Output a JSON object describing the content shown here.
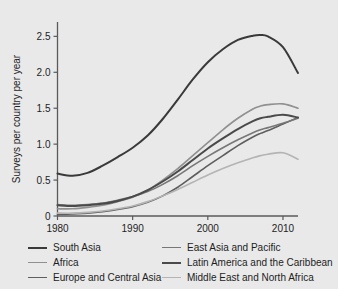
{
  "chart_data": {
    "type": "line",
    "title": "",
    "xlabel": "",
    "ylabel": "Surveys per country per year",
    "xlim": [
      1980,
      2012
    ],
    "ylim": [
      0,
      2.7
    ],
    "grid": false,
    "legend_position": "bottom",
    "x_ticks": [
      "1980",
      "1990",
      "2000",
      "2010"
    ],
    "x_tick_values": [
      1980,
      1990,
      2000,
      2010
    ],
    "y_ticks": [
      "0",
      "0.5",
      "1.0",
      "1.5",
      "2.0",
      "2.5"
    ],
    "y_tick_values": [
      0,
      0.5,
      1.0,
      1.5,
      2.0,
      2.5
    ],
    "x": [
      1980,
      1982,
      1984,
      1986,
      1988,
      1990,
      1992,
      1994,
      1996,
      1998,
      2000,
      2002,
      2004,
      2006,
      2007,
      2008,
      2010,
      2012
    ],
    "series": [
      {
        "name": "South Asia",
        "color": "#3a3a3a",
        "width": 2.0,
        "values": [
          0.59,
          0.56,
          0.6,
          0.7,
          0.82,
          0.95,
          1.12,
          1.35,
          1.62,
          1.9,
          2.14,
          2.32,
          2.45,
          2.51,
          2.52,
          2.5,
          2.35,
          1.99
        ]
      },
      {
        "name": "Africa",
        "color": "#909090",
        "width": 1.6,
        "values": [
          0.1,
          0.1,
          0.12,
          0.15,
          0.2,
          0.26,
          0.36,
          0.5,
          0.66,
          0.84,
          1.02,
          1.2,
          1.36,
          1.49,
          1.53,
          1.55,
          1.56,
          1.5
        ]
      },
      {
        "name": "Europe and Central Asia",
        "color": "#5e5e5e",
        "width": 1.6,
        "values": [
          0.02,
          0.03,
          0.04,
          0.06,
          0.09,
          0.13,
          0.19,
          0.28,
          0.4,
          0.55,
          0.7,
          0.84,
          0.98,
          1.1,
          1.15,
          1.19,
          1.28,
          1.37
        ]
      },
      {
        "name": "East Asia and Pacific",
        "color": "#777777",
        "width": 1.6,
        "values": [
          0.16,
          0.15,
          0.16,
          0.18,
          0.22,
          0.27,
          0.34,
          0.44,
          0.56,
          0.7,
          0.83,
          0.95,
          1.06,
          1.16,
          1.2,
          1.23,
          1.29,
          1.36
        ]
      },
      {
        "name": "Latin America and the Caribbean",
        "color": "#4a4a4a",
        "width": 2.0,
        "values": [
          0.15,
          0.14,
          0.15,
          0.17,
          0.21,
          0.27,
          0.36,
          0.48,
          0.62,
          0.78,
          0.94,
          1.08,
          1.21,
          1.32,
          1.36,
          1.38,
          1.41,
          1.37
        ]
      },
      {
        "name": "Middle East and North Africa",
        "color": "#b4b4b4",
        "width": 1.6,
        "values": [
          0.04,
          0.04,
          0.05,
          0.07,
          0.1,
          0.14,
          0.2,
          0.28,
          0.37,
          0.47,
          0.57,
          0.66,
          0.74,
          0.81,
          0.84,
          0.86,
          0.88,
          0.79
        ]
      }
    ]
  },
  "legend": {
    "columns": [
      {
        "entries": [
          {
            "label": "South Asia",
            "color": "#3a3a3a",
            "width": 2.0
          },
          {
            "label": "Africa",
            "color": "#909090",
            "width": 1.6
          },
          {
            "label": "Europe and Central Asia",
            "color": "#5e5e5e",
            "width": 1.6
          }
        ]
      },
      {
        "entries": [
          {
            "label": "East Asia and Pacific",
            "color": "#777777",
            "width": 1.6
          },
          {
            "label": "Latin America and the Caribbean",
            "color": "#4a4a4a",
            "width": 2.0
          },
          {
            "label": "Middle East and North Africa",
            "color": "#b4b4b4",
            "width": 1.6
          }
        ]
      }
    ]
  },
  "style": {
    "figure_background": "#e9e9e9",
    "page_background": "#ffffff",
    "axis_color": "#5a5a5a",
    "text_color": "#1d1d1d"
  }
}
